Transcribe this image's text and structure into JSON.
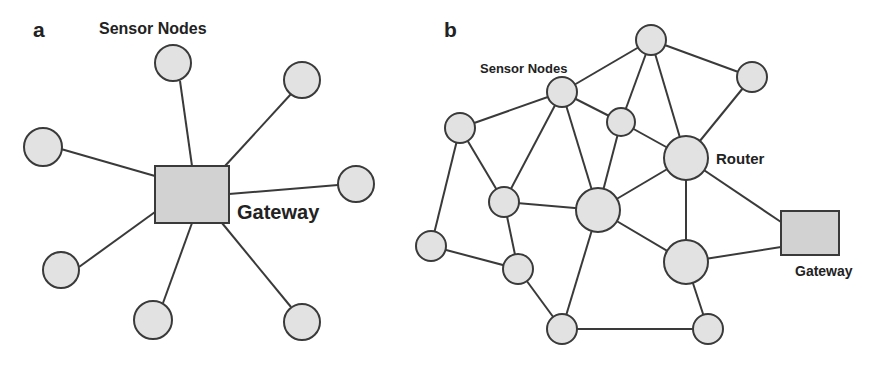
{
  "panels": [
    {
      "id": "a",
      "label": "a",
      "topology": "star",
      "sensor_label": "Sensor Nodes",
      "gateway_label": "Gateway"
    },
    {
      "id": "b",
      "label": "b",
      "topology": "mesh",
      "sensor_label": "Sensor Nodes",
      "router_label": "Router",
      "gateway_label": "Gateway"
    }
  ]
}
